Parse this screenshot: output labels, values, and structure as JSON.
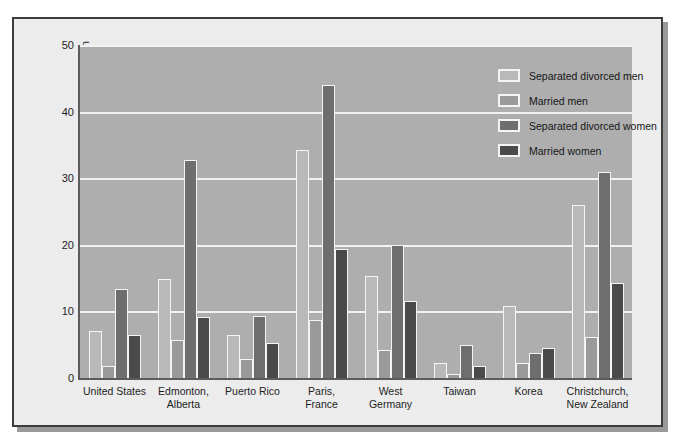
{
  "chart_data": {
    "type": "bar",
    "title": "",
    "xlabel": "",
    "ylabel": "Lifetime rate of major depression per 100 population",
    "ylim": [
      0,
      50
    ],
    "yticks": [
      0,
      10,
      20,
      30,
      40,
      50
    ],
    "grid": true,
    "legend_position": "top-right",
    "categories": [
      "United States",
      "Edmonton, Alberta",
      "Puerto Rico",
      "Paris, France",
      "West Germany",
      "Taiwan",
      "Korea",
      "Christchurch, New Zealand"
    ],
    "category_lines": [
      [
        "United States"
      ],
      [
        "Edmonton,",
        "Alberta"
      ],
      [
        "Puerto Rico"
      ],
      [
        "Paris,",
        "France"
      ],
      [
        "West Germany"
      ],
      [
        "Taiwan"
      ],
      [
        "Korea"
      ],
      [
        "Christchurch,",
        "New Zealand"
      ]
    ],
    "series": [
      {
        "name": "Separated divorced men",
        "color": "#b9b9b9",
        "values": [
          7.0,
          14.8,
          6.5,
          34.3,
          15.3,
          2.2,
          10.8,
          26.0
        ]
      },
      {
        "name": "Married men",
        "color": "#9a9a9a",
        "values": [
          1.8,
          5.7,
          2.8,
          8.7,
          4.2,
          0.6,
          2.3,
          6.2
        ]
      },
      {
        "name": "Separated divorced women",
        "color": "#6e6e6e",
        "values": [
          13.3,
          32.8,
          9.3,
          44.0,
          20.0,
          5.0,
          3.8,
          31.0
        ]
      },
      {
        "name": "Married women",
        "color": "#4a4a4a",
        "values": [
          6.5,
          9.2,
          5.3,
          19.4,
          11.6,
          1.8,
          4.5,
          14.3
        ]
      }
    ]
  },
  "colors": {
    "plot_background": "#aeaeae",
    "figure_background": "#ececec",
    "gridline": "#f2f2f2",
    "axis": "#5c5c5c",
    "frame_border": "#3c3c3c",
    "text": "#1d1d1d"
  }
}
